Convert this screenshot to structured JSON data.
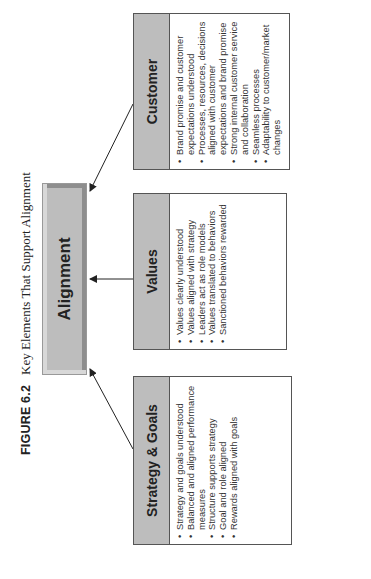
{
  "figure": {
    "label": "FIGURE 6.2",
    "caption": "Key Elements That Support Alignment"
  },
  "center": {
    "label": "Alignment"
  },
  "boxes": [
    {
      "title": "Strategy & Goals",
      "items": [
        "Strategy and goals understood",
        "Balanced and aligned performance measures",
        "Structure supports strategy",
        "Goal and role aligned",
        "Rewards aligned with goals"
      ]
    },
    {
      "title": "Values",
      "items": [
        "Values clearly understood",
        "Values aligned with strategy",
        "Leaders act as role models",
        "Values translated to behaviors",
        "Sanctioned behaviors rewarded"
      ]
    },
    {
      "title": "Customer",
      "items": [
        "Brand promise and customer expectations understood",
        "Processes, resources, decisions aligned with customer expectations and brand promise",
        "Strong internal customer service and collaboration",
        "Seamless processes",
        "Adaptability to customer/market changes"
      ]
    }
  ],
  "colors": {
    "header_fill": "#bdbdbd",
    "border": "#555555",
    "arrow": "#222222"
  }
}
